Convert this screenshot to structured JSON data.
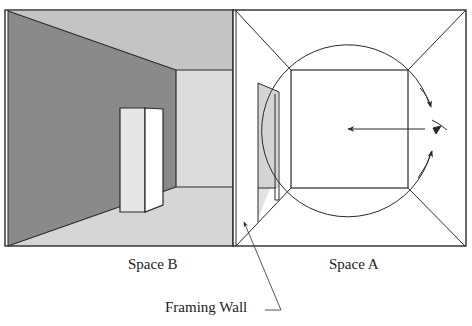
{
  "figure": {
    "type": "architectural-perspective-diagram",
    "panels": [
      {
        "id": "space-b",
        "label": "Space B",
        "view": "one-point perspective interior with freestanding pillar"
      },
      {
        "id": "space-a",
        "label": "Space A",
        "view": "frontal view with circular rotation arrows and eye symbol"
      }
    ],
    "annotations": {
      "framing_wall": "Framing Wall"
    },
    "colors": {
      "line": "#2a2a2a",
      "left_wall": "#8a8a8a",
      "ceiling": "#c4c4c4",
      "floor": "#d6d6d6",
      "back_wall": "#dcdcdc",
      "pillar_front": "#e6e6e6",
      "pillar_side": "#ffffff",
      "door_panel": "#d4d4d4",
      "background": "#ffffff"
    },
    "icons": [
      "eye-icon",
      "direction-arrow-icon",
      "rotation-arrow-icon"
    ]
  }
}
